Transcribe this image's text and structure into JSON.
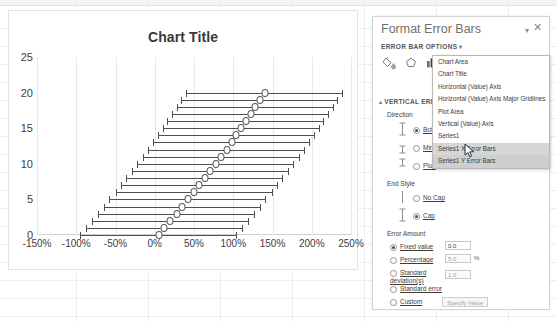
{
  "chart": {
    "title": "Chart Title",
    "y_ticks": [
      "0",
      "5",
      "10",
      "15",
      "20",
      "25"
    ],
    "x_ticks": [
      "-150%",
      "-100%",
      "-50%",
      "0%",
      "50%",
      "100%",
      "150%",
      "200%",
      "250%"
    ]
  },
  "chart_data": {
    "type": "scatter",
    "title": "Chart Title",
    "xlabel": "",
    "ylabel": "",
    "xlim": [
      -150,
      250
    ],
    "ylim": [
      0,
      25
    ],
    "grid": true,
    "legend": false,
    "x_tick_values": [
      -150,
      -100,
      -50,
      0,
      50,
      100,
      150,
      200,
      250
    ],
    "x_tick_labels": [
      "-150%",
      "-100%",
      "-50%",
      "0%",
      "50%",
      "100%",
      "150%",
      "200%",
      "250%"
    ],
    "y_tick_values": [
      0,
      5,
      10,
      15,
      20,
      25
    ],
    "y_tick_labels": [
      "0",
      "5",
      "10",
      "15",
      "20",
      "25"
    ],
    "series": [
      {
        "name": "Series1",
        "x": [
          5,
          12,
          20,
          28,
          35,
          42,
          50,
          57,
          64,
          71,
          78,
          85,
          92,
          98,
          104,
          110,
          116,
          122,
          128,
          134,
          140
        ],
        "y": [
          0,
          1,
          2,
          3,
          4,
          5,
          6,
          7,
          8,
          9,
          10,
          11,
          12,
          13,
          14,
          15,
          16,
          17,
          18,
          19,
          20
        ],
        "x_error": [
          100,
          100,
          100,
          100,
          100,
          100,
          100,
          100,
          100,
          100,
          100,
          100,
          100,
          100,
          100,
          100,
          100,
          100,
          100,
          100,
          100
        ],
        "y_error": [
          0.4,
          0.4,
          0.4,
          0.4,
          0.4,
          0.4,
          0.4,
          0.4,
          0.4,
          0.4,
          0.4,
          0.4,
          0.4,
          0.4,
          0.4,
          0.4,
          0.4,
          0.4,
          0.4,
          0.4,
          0.4
        ]
      }
    ]
  },
  "pane": {
    "title": "Format Error Bars",
    "dropdown_caret": "▾",
    "close": "✕",
    "options_header": "ERROR BAR OPTIONS",
    "options_caret": "▾",
    "icons": [
      {
        "name": "fill-line-icon",
        "label": "Fill & Line"
      },
      {
        "name": "effects-icon",
        "label": "Effects"
      },
      {
        "name": "error-bar-options-icon",
        "label": "Error Bar Options"
      }
    ],
    "section": {
      "triangle": "▴",
      "title": "VERTICAL ERROR BARS"
    },
    "direction": {
      "label": "Direction",
      "options": [
        {
          "label": "Both",
          "selected": true
        },
        {
          "label": "Minus",
          "selected": false
        },
        {
          "label": "Plus",
          "selected": false
        }
      ]
    },
    "end_style": {
      "label": "End Style",
      "options": [
        {
          "label": "No Cap",
          "selected": false
        },
        {
          "label": "Cap",
          "selected": true
        }
      ]
    },
    "error_amount": {
      "label": "Error Amount",
      "options": [
        {
          "label": "Fixed value",
          "selected": true,
          "value": "0.0",
          "unit": ""
        },
        {
          "label": "Percentage",
          "selected": false,
          "value": "5.0",
          "unit": "%"
        },
        {
          "label": "Standard deviation(s)",
          "selected": false,
          "value": "1.0",
          "unit": ""
        },
        {
          "label": "Standard error",
          "selected": false,
          "value": "",
          "unit": ""
        },
        {
          "label": "Custom",
          "selected": false,
          "value": "",
          "unit": ""
        }
      ],
      "specify_button": "Specify Value"
    }
  },
  "dropdown": {
    "items": [
      {
        "label": "Chart Area",
        "state": "normal"
      },
      {
        "label": "Chart Title",
        "state": "normal"
      },
      {
        "label": "Horizontal (Value) Axis",
        "state": "normal"
      },
      {
        "label": "Horizontal (Value) Axis Major Gridlines",
        "state": "normal"
      },
      {
        "label": "Plot Area",
        "state": "normal"
      },
      {
        "label": "Vertical (Value) Axis",
        "state": "normal"
      },
      {
        "label": "Series1",
        "state": "normal"
      },
      {
        "label": "Series1 X Error Bars",
        "state": "selected"
      },
      {
        "label": "Series1 Y Error Bars",
        "state": "highlighted"
      }
    ]
  }
}
